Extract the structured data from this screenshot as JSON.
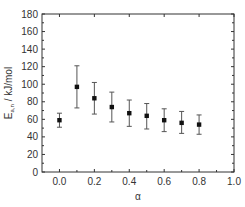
{
  "chart_data": {
    "type": "scatter",
    "title": "",
    "xlabel": "α",
    "ylabel": "E_a,n / kJ/mol",
    "ylabel_main": "E",
    "ylabel_sub": "a,n",
    "ylabel_rest": " / kJ/mol",
    "xlim": [
      -0.1,
      1.0
    ],
    "ylim": [
      0,
      180
    ],
    "x_ticks": [
      "0.0",
      "0.2",
      "0.4",
      "0.6",
      "0.8",
      "1.0"
    ],
    "y_ticks": [
      "0",
      "20",
      "40",
      "60",
      "80",
      "100",
      "120",
      "140",
      "160",
      "180"
    ],
    "grid": false,
    "legend": null,
    "series": [
      {
        "name": "Activation energy",
        "x": [
          0.0,
          0.1,
          0.2,
          0.3,
          0.4,
          0.5,
          0.6,
          0.7,
          0.8
        ],
        "y": [
          59,
          97,
          84,
          74,
          67,
          64,
          59,
          56,
          54
        ],
        "err_low": [
          51,
          73,
          66,
          57,
          52,
          49,
          46,
          44,
          43
        ],
        "err_high": [
          67,
          121,
          102,
          91,
          82,
          78,
          72,
          69,
          65
        ],
        "color": "#111111"
      }
    ]
  }
}
